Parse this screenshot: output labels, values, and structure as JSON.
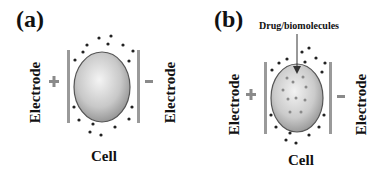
{
  "panels": [
    {
      "tag": "(a)",
      "left_electrode_label": "Electrode",
      "right_electrode_label": "Electrode",
      "left_sign": "+",
      "right_sign": "-",
      "cell_label": "Cell"
    },
    {
      "tag": "(b)",
      "left_electrode_label": "Electrode",
      "right_electrode_label": "Electrode",
      "left_sign": "+",
      "right_sign": "-",
      "cell_label": "Cell",
      "annotation": "Drug/biomolecules"
    }
  ],
  "colors": {
    "electrode": "#9a9a9a",
    "cell_outline": "#555555",
    "dot": "#222222",
    "inner_dot": "#8a8a8a"
  }
}
